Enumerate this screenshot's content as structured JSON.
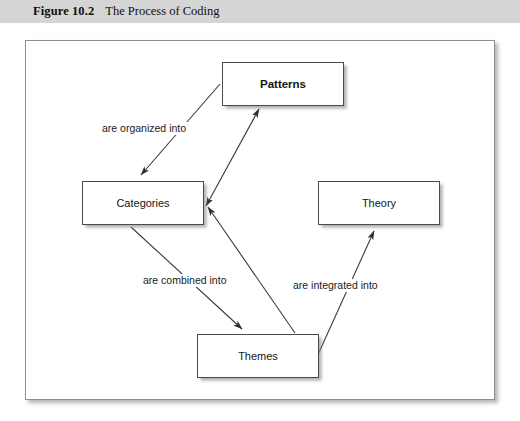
{
  "caption": {
    "number": "Figure 10.2",
    "title": "The Process of Coding"
  },
  "diagram": {
    "type": "flow-diagram",
    "nodes": [
      {
        "id": "patterns",
        "label": "Patterns",
        "bold": true
      },
      {
        "id": "categories",
        "label": "Categories",
        "bold": false
      },
      {
        "id": "theory",
        "label": "Theory",
        "bold": false
      },
      {
        "id": "themes",
        "label": "Themes",
        "bold": false
      }
    ],
    "edges": [
      {
        "id": "patterns-to-categories",
        "from": "patterns",
        "to": "categories",
        "label": "are organized into",
        "arrowheads": "end"
      },
      {
        "id": "categories-to-themes",
        "from": "categories",
        "to": "themes",
        "label": "are combined into",
        "arrowheads": "end"
      },
      {
        "id": "themes-to-theory",
        "from": "themes",
        "to": "theory",
        "label": "are integrated into",
        "arrowheads": "end"
      },
      {
        "id": "categories-to-patterns",
        "from": "categories",
        "to": "patterns",
        "label": "",
        "arrowheads": "both"
      },
      {
        "id": "themes-to-categories",
        "from": "themes",
        "to": "categories",
        "label": "",
        "arrowheads": "end"
      }
    ],
    "labels": {
      "organized": "are organized into",
      "combined": "are combined into",
      "integrated": "are integrated into"
    }
  },
  "colors": {
    "caption_band": "#d5d5d5",
    "frame_border": "#8e8e8e",
    "box_border": "#4a4a4a",
    "line": "#3a3a3a",
    "text": "#141414",
    "page_background": "#ffffff"
  }
}
